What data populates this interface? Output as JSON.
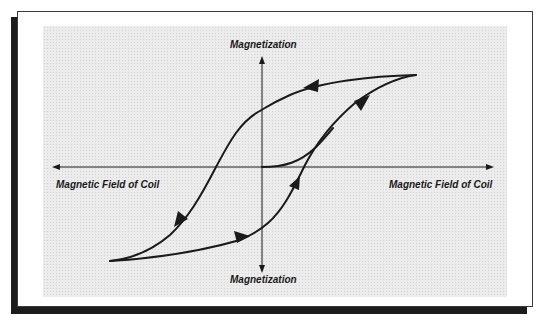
{
  "diagram": {
    "labels": {
      "y_top": "Magnetization",
      "y_bottom": "Magnetization",
      "x_left": "Magnetic Field of Coil",
      "x_right": "Magnetic Field of Coil"
    },
    "colors": {
      "line": "#1a1a1a",
      "plot_background": "#ececec",
      "frame_shadow": "#1c1c1c"
    },
    "curves": [
      {
        "name": "initial-magnetization-curve",
        "description": "Starts at origin and rises to join the ascending branch"
      },
      {
        "name": "descending-branch",
        "description": "From positive saturation (top right) down to negative saturation (bottom left)",
        "arrows": 2
      },
      {
        "name": "ascending-branch",
        "description": "From negative saturation (bottom left) up to positive saturation (top right)",
        "arrows": 3
      }
    ]
  }
}
